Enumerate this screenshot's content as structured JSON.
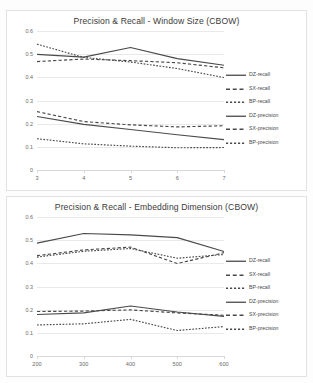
{
  "document": {
    "background": "#fdfdfd",
    "line_color": "#4a4a4a"
  },
  "charts": [
    {
      "id": "window-size",
      "title": "Precision & Recall - Window Size (CBOW)",
      "chart_data": {
        "type": "line",
        "title": "Precision & Recall - Window Size (CBOW)",
        "xlabel": "",
        "ylabel": "",
        "categories": [
          "3",
          "4",
          "5",
          "6",
          "7"
        ],
        "x": [
          3,
          4,
          5,
          6,
          7
        ],
        "ylim": [
          0,
          0.6
        ],
        "yticks": [
          0,
          0.1,
          0.2,
          0.3,
          0.4,
          0.5,
          0.6
        ],
        "ytick_labels": [
          "0",
          "0.1",
          "0.2",
          "0.3",
          "0.4",
          "0.5",
          "0.6"
        ],
        "grid": true,
        "legend_position": "right",
        "series": [
          {
            "name": "DZ-recall",
            "style": "solid",
            "values": [
              0.499,
              0.487,
              0.529,
              0.481,
              0.452
            ]
          },
          {
            "name": "SX-recall",
            "style": "dashed",
            "values": [
              0.468,
              0.479,
              0.472,
              0.463,
              0.441
            ]
          },
          {
            "name": "BP-recall",
            "style": "dotted",
            "values": [
              0.543,
              0.486,
              0.466,
              0.438,
              0.399
            ]
          },
          {
            "name": "DZ-precision",
            "style": "solid",
            "values": [
              0.231,
              0.197,
              0.175,
              0.152,
              0.131
            ]
          },
          {
            "name": "SX-precision",
            "style": "dashed",
            "values": [
              0.252,
              0.209,
              0.195,
              0.186,
              0.191
            ]
          },
          {
            "name": "BP-precision",
            "style": "dotted",
            "values": [
              0.135,
              0.113,
              0.103,
              0.096,
              0.097
            ]
          }
        ]
      }
    },
    {
      "id": "embedding-dimension",
      "title": "Precision & Recall - Embedding Dimension (CBOW)",
      "chart_data": {
        "type": "line",
        "title": "Precision & Recall - Embedding Dimension (CBOW)",
        "xlabel": "",
        "ylabel": "",
        "categories": [
          "200",
          "300",
          "400",
          "500",
          "600"
        ],
        "x": [
          200,
          300,
          400,
          500,
          600
        ],
        "ylim": [
          0,
          0.6
        ],
        "yticks": [
          0,
          0.1,
          0.2,
          0.3,
          0.4,
          0.5,
          0.6
        ],
        "ytick_labels": [
          "0",
          "0.1",
          "0.2",
          "0.3",
          "0.4",
          "0.5",
          "0.6"
        ],
        "grid": true,
        "legend_position": "right",
        "series": [
          {
            "name": "DZ-recall",
            "style": "solid",
            "values": [
              0.487,
              0.529,
              0.523,
              0.511,
              0.451
            ]
          },
          {
            "name": "SX-recall",
            "style": "dashed",
            "values": [
              0.433,
              0.458,
              0.47,
              0.399,
              0.446
            ]
          },
          {
            "name": "BP-recall",
            "style": "dotted",
            "values": [
              0.427,
              0.452,
              0.464,
              0.422,
              0.438
            ]
          },
          {
            "name": "DZ-precision",
            "style": "solid",
            "values": [
              0.179,
              0.186,
              0.216,
              0.19,
              0.171
            ]
          },
          {
            "name": "SX-precision",
            "style": "dashed",
            "values": [
              0.192,
              0.194,
              0.199,
              0.186,
              0.176
            ]
          },
          {
            "name": "BP-precision",
            "style": "dotted",
            "values": [
              0.134,
              0.139,
              0.158,
              0.11,
              0.127
            ]
          }
        ]
      }
    }
  ],
  "legend": {
    "entries": [
      {
        "label": "DZ-recall",
        "style": "solid"
      },
      {
        "label": "SX-recall",
        "style": "dashed"
      },
      {
        "label": "BP-recall",
        "style": "dotted"
      },
      {
        "label": "DZ-precision",
        "style": "solid"
      },
      {
        "label": "SX-precision",
        "style": "dashed"
      },
      {
        "label": "BP-precision",
        "style": "dotted"
      }
    ]
  }
}
